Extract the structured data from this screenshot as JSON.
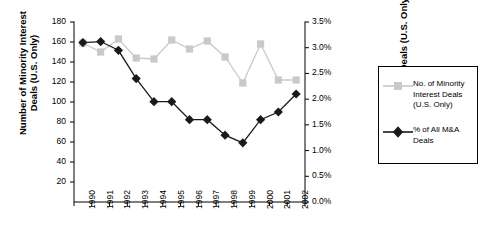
{
  "chart_data": {
    "type": "line",
    "title": "",
    "xlabel": "",
    "categories": [
      "1990",
      "1991",
      "1992",
      "1993",
      "1994",
      "1995",
      "1996",
      "1997",
      "1998",
      "1999",
      "2000",
      "2001",
      "2002"
    ],
    "grid": false,
    "legend_position": "right",
    "axes": {
      "left": {
        "label": "Number of Minority Interest\nDeals (U.S. Only)",
        "ticks": [
          "20",
          "40",
          "60",
          "80",
          "100",
          "120",
          "140",
          "160",
          "180"
        ],
        "tick_values": [
          20,
          40,
          60,
          80,
          100,
          120,
          140,
          160,
          180
        ],
        "min": 0,
        "max": 180
      },
      "right": {
        "label": "% of All M&A Deals (U.S. Only)",
        "ticks": [
          "0.0%",
          "0.5%",
          "1.0%",
          "1.5%",
          "2.0%",
          "2.5%",
          "3.0%",
          "3.5%"
        ],
        "tick_values": [
          0.0,
          0.5,
          1.0,
          1.5,
          2.0,
          2.5,
          3.0,
          3.5
        ],
        "min": 0,
        "max": 3.5
      }
    },
    "series": [
      {
        "name": "No. of Minority Interest Deals (U.S. Only)",
        "axis": "left",
        "color": "#c9c9c9",
        "marker": "square",
        "values": [
          159,
          150,
          163,
          144,
          143,
          162,
          153,
          161,
          145,
          119,
          158,
          122,
          122
        ]
      },
      {
        "name": "% of All M&A Deals",
        "axis": "right",
        "color": "#1a1a1a",
        "marker": "diamond",
        "values": [
          3.1,
          3.12,
          2.95,
          2.4,
          1.95,
          1.95,
          1.6,
          1.6,
          1.3,
          1.15,
          1.6,
          1.75,
          2.1
        ]
      }
    ]
  },
  "legend": {
    "items": [
      {
        "label": "No. of Minority\nInterest Deals\n(U.S. Only)",
        "marker": "square",
        "color": "#c9c9c9"
      },
      {
        "label": "% of All M&A\nDeals",
        "marker": "diamond",
        "color": "#1a1a1a"
      }
    ]
  }
}
